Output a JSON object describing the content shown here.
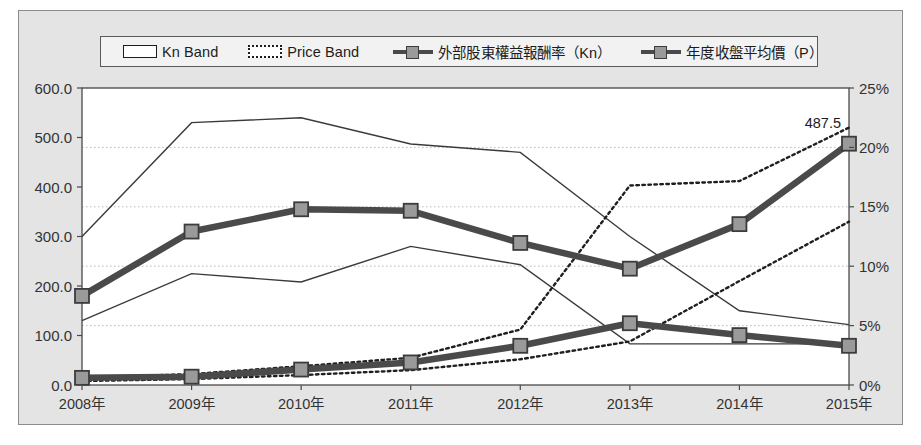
{
  "chart_data": {
    "type": "line",
    "title": "",
    "xlabel": "",
    "ylabel": "",
    "categories": [
      "2008年",
      "2009年",
      "2010年",
      "2011年",
      "2012年",
      "2013年",
      "2014年",
      "2015年"
    ],
    "left_axis": {
      "ylim": [
        0,
        600
      ],
      "ticks": [
        0,
        100,
        200,
        300,
        400,
        500,
        600
      ],
      "tick_labels": [
        "0.0",
        "100.0",
        "200.0",
        "300.0",
        "400.0",
        "500.0",
        "600.0"
      ]
    },
    "right_axis": {
      "ylim": [
        0,
        25
      ],
      "ticks": [
        0,
        5,
        10,
        15,
        20,
        25
      ],
      "tick_labels": [
        "0%",
        "5%",
        "10%",
        "15%",
        "20%",
        "25%"
      ]
    },
    "grid": "horizontal-dotted",
    "legend_position": "top",
    "series": [
      {
        "name": "Kn Band",
        "type": "band",
        "style": "solid",
        "axis": "left",
        "upper": [
          300,
          530,
          540,
          487,
          470,
          300,
          150,
          122
        ],
        "lower": [
          130,
          225,
          208,
          280,
          243,
          83,
          83,
          83
        ]
      },
      {
        "name": "Price Band",
        "type": "band",
        "style": "dotted",
        "axis": "left",
        "upper": [
          15,
          22,
          38,
          55,
          112,
          403,
          412,
          520
        ],
        "lower": [
          8,
          12,
          20,
          30,
          52,
          88,
          210,
          330
        ]
      },
      {
        "name": "外部股東權益報酬率（Kn）",
        "type": "marker-line",
        "axis": "right",
        "values": [
          0.6,
          0.7,
          1.3,
          1.9,
          3.3,
          5.2,
          4.2,
          3.3
        ]
      },
      {
        "name": "年度收盤平均價（P）",
        "type": "marker-line",
        "axis": "left",
        "values": [
          180,
          310,
          355,
          352,
          287,
          235,
          325,
          487.5
        ]
      }
    ],
    "annotations": [
      {
        "text": "487.5",
        "series": "年度收盤平均價（P）",
        "category": "2015年",
        "value": 487.5
      }
    ],
    "colors": {
      "plot_background": "#ffffff",
      "chart_background": "#e4e4e4",
      "band_line": "#3a3a3a",
      "thick_line": "#4a4a4a",
      "marker_fill": "#9a9a9a",
      "marker_edge": "#3c3c3c",
      "grid": "#b9b9b9",
      "axis_text": "#333333"
    }
  },
  "legend": {
    "items": [
      {
        "label": "Kn Band",
        "glyph": "band-solid-swatch"
      },
      {
        "label": "Price Band",
        "glyph": "band-dotted-swatch"
      },
      {
        "label": "外部股東權益報酬率（Kn）",
        "glyph": "marker-line-swatch"
      },
      {
        "label": "年度收盤平均價（P）",
        "glyph": "marker-line-swatch"
      }
    ]
  }
}
